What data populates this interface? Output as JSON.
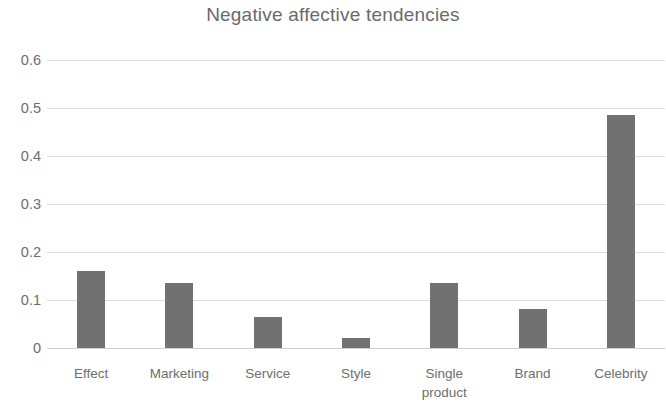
{
  "chart_data": {
    "type": "bar",
    "title": "Negative affective tendencies",
    "xlabel": "",
    "ylabel": "",
    "categories": [
      "Effect",
      "Marketing",
      "Service",
      "Style",
      "Single\nproduct",
      "Brand",
      "Celebrity"
    ],
    "values": [
      0.16,
      0.135,
      0.065,
      0.02,
      0.135,
      0.082,
      0.485
    ],
    "ylim": [
      0,
      0.6
    ],
    "yticks": [
      "0",
      "0.1",
      "0.2",
      "0.3",
      "0.4",
      "0.5",
      "0.6"
    ],
    "ytick_values": [
      0,
      0.1,
      0.2,
      0.3,
      0.4,
      0.5,
      0.6
    ],
    "grid": true,
    "legend": false,
    "bar_color": "#717171",
    "gridline_color": "#dcdcdc",
    "text_color": "#6e6e6e",
    "background": "#ffffff"
  }
}
